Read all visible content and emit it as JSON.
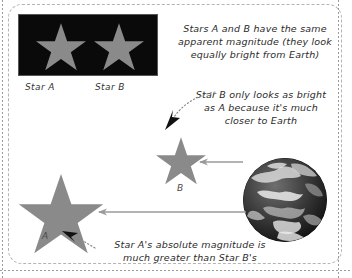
{
  "diagram": {
    "title_text_absent": "",
    "colors": {
      "star_fill": "#8a8a8a",
      "panel_background": "#0a0a0a",
      "arrow_line": "#9a9a9a",
      "leader_line": "#777777",
      "arrowhead": "#111111",
      "frame_border": "#b4b4b4",
      "text": "#2b2b2b"
    },
    "photo_panel": {
      "name": "night-sky-panel",
      "stars": [
        {
          "label": "Star A",
          "size": 46
        },
        {
          "label": "Star B",
          "size": 46
        }
      ],
      "captions": [
        "Star A",
        "Star B"
      ]
    },
    "notes": [
      {
        "id": "apparent-magnitude-note",
        "lines": [
          "Stars A and B have the same",
          "apparent magnitude (they look",
          "equally bright from Earth)"
        ]
      },
      {
        "id": "star-b-distance-note",
        "lines": [
          "Star B only looks as bright",
          "as A because it's much",
          "closer to Earth"
        ]
      },
      {
        "id": "star-a-absolute-magnitude-note",
        "lines": [
          "Star A's absolute magnitude is",
          "much greater than Star B's"
        ]
      }
    ],
    "scene": {
      "stars": [
        {
          "id": "scene-star-b",
          "letter": "B",
          "size": 52
        },
        {
          "id": "scene-star-a",
          "letter": "A",
          "size": 88
        }
      ],
      "earth": {
        "id": "earth-globe",
        "label": "Earth"
      },
      "sight_lines": [
        {
          "id": "sight-line-earth-to-star-b",
          "from": "Earth",
          "to": "Star B"
        },
        {
          "id": "sight-line-earth-to-star-a",
          "from": "Earth",
          "to": "Star A"
        }
      ]
    }
  }
}
